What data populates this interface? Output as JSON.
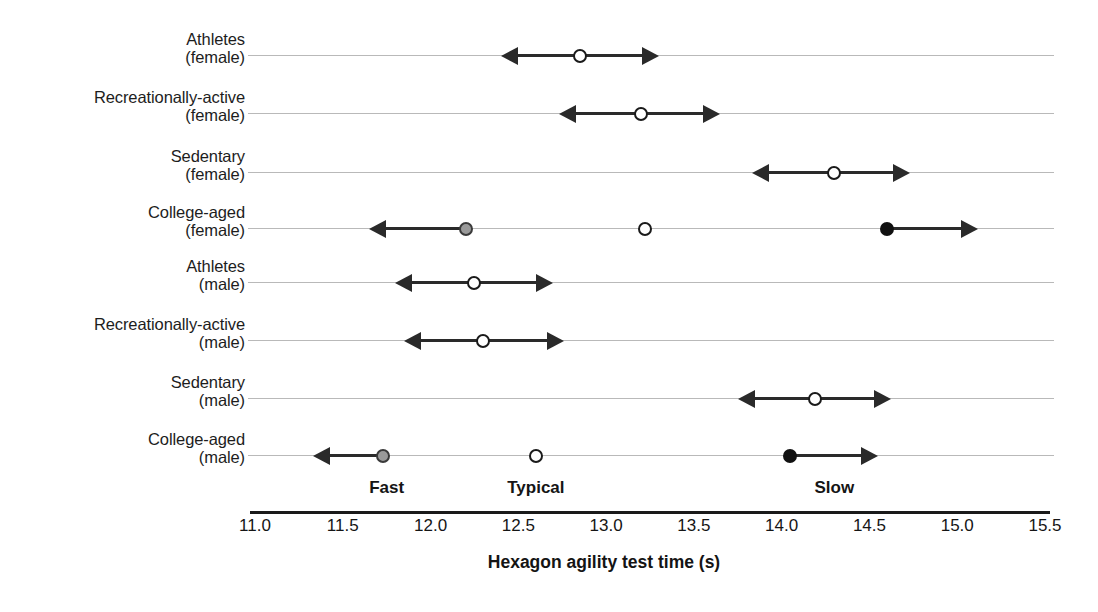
{
  "chart_data": {
    "type": "scatter",
    "title": "",
    "xlabel": "Hexagon agility test time (s)",
    "ylabel": "",
    "xlim": [
      11.0,
      15.5
    ],
    "grid": true,
    "legend": "none",
    "tick_labels": [
      "11.0",
      "11.5",
      "12.0",
      "12.5",
      "13.0",
      "13.5",
      "14.0",
      "14.5",
      "15.0",
      "15.5"
    ],
    "tick_values": [
      11.0,
      11.5,
      12.0,
      12.5,
      13.0,
      13.5,
      14.0,
      14.5,
      15.0,
      15.5
    ],
    "zone_annotations": [
      {
        "label": "Fast",
        "x": 11.75
      },
      {
        "label": "Typical",
        "x": 12.6
      },
      {
        "label": "Slow",
        "x": 14.3
      }
    ],
    "categories": [
      {
        "line1": "Athletes",
        "line2": "(female)"
      },
      {
        "line1": "Recreationally-active",
        "line2": "(female)"
      },
      {
        "line1": "Sedentary",
        "line2": "(female)"
      },
      {
        "line1": "College-aged",
        "line2": "(female)"
      },
      {
        "line1": "Athletes",
        "line2": "(male)"
      },
      {
        "line1": "Recreationally-active",
        "line2": "(male)"
      },
      {
        "line1": "Sedentary",
        "line2": "(male)"
      },
      {
        "line1": "College-aged",
        "line2": "(male)"
      }
    ],
    "rows": [
      {
        "category": "Athletes (female)",
        "markers": [
          {
            "style": "open",
            "x": 12.85,
            "arrow_left": 12.4,
            "arrow_right": 13.3
          }
        ]
      },
      {
        "category": "Recreationally-active (female)",
        "markers": [
          {
            "style": "open",
            "x": 13.2,
            "arrow_left": 12.73,
            "arrow_right": 13.65
          }
        ]
      },
      {
        "category": "Sedentary (female)",
        "markers": [
          {
            "style": "open",
            "x": 14.3,
            "arrow_left": 13.83,
            "arrow_right": 14.73
          }
        ]
      },
      {
        "category": "College-aged (female)",
        "markers": [
          {
            "style": "gray",
            "x": 12.2,
            "arrow_left": 11.65,
            "arrow_right": null
          },
          {
            "style": "open",
            "x": 13.22,
            "arrow_left": null,
            "arrow_right": null
          },
          {
            "style": "filled",
            "x": 14.6,
            "arrow_left": null,
            "arrow_right": 15.12
          }
        ]
      },
      {
        "category": "Athletes (male)",
        "markers": [
          {
            "style": "open",
            "x": 12.25,
            "arrow_left": 11.8,
            "arrow_right": 12.7
          }
        ]
      },
      {
        "category": "Recreationally-active (male)",
        "markers": [
          {
            "style": "open",
            "x": 12.3,
            "arrow_left": 11.85,
            "arrow_right": 12.76
          }
        ]
      },
      {
        "category": "Sedentary (male)",
        "markers": [
          {
            "style": "open",
            "x": 14.19,
            "arrow_left": 13.75,
            "arrow_right": 14.62
          }
        ]
      },
      {
        "category": "College-aged (male)",
        "markers": [
          {
            "style": "gray",
            "x": 11.73,
            "arrow_left": 11.33,
            "arrow_right": null
          },
          {
            "style": "open",
            "x": 12.6,
            "arrow_left": null,
            "arrow_right": null
          },
          {
            "style": "filled",
            "x": 14.05,
            "arrow_left": null,
            "arrow_right": 14.55
          }
        ]
      }
    ],
    "colors": {
      "line": "#2a2a2a",
      "gridline": "#b9b9b9",
      "marker_open_fill": "#ffffff",
      "marker_gray_fill": "#9a9a9a",
      "marker_filled_fill": "#111111",
      "axis": "#1a1a1a",
      "text": "#151515"
    }
  }
}
